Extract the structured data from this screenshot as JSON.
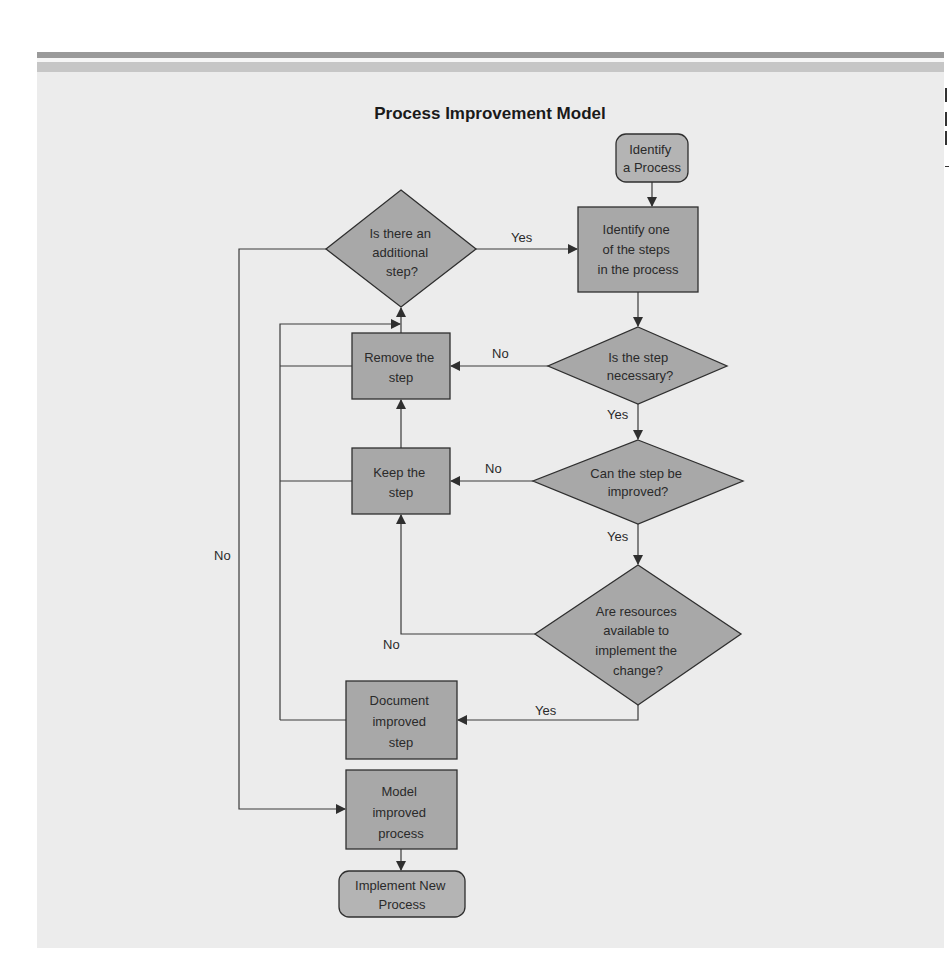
{
  "diagram": {
    "title": "Process Improvement Model",
    "nodes": {
      "start": {
        "lines": [
          "Identify",
          "a Process"
        ],
        "shape": "terminal"
      },
      "identify_step": {
        "lines": [
          "Identify one",
          "of the steps",
          "in the process"
        ],
        "shape": "process"
      },
      "necessary": {
        "lines": [
          "Is the step",
          "necessary?"
        ],
        "shape": "decision"
      },
      "improvable": {
        "lines": [
          "Can the step be",
          "improved?"
        ],
        "shape": "decision"
      },
      "resources": {
        "lines": [
          "Are resources",
          "available to",
          "implement the",
          "change?"
        ],
        "shape": "decision"
      },
      "remove": {
        "lines": [
          "Remove the",
          "step"
        ],
        "shape": "process"
      },
      "keep": {
        "lines": [
          "Keep the",
          "step"
        ],
        "shape": "process"
      },
      "document": {
        "lines": [
          "Document",
          "improved",
          "step"
        ],
        "shape": "process"
      },
      "additional": {
        "lines": [
          "Is there an",
          "additional",
          "step?"
        ],
        "shape": "decision"
      },
      "model": {
        "lines": [
          "Model",
          "improved",
          "process"
        ],
        "shape": "process"
      },
      "end": {
        "lines": [
          "Implement New",
          "Process"
        ],
        "shape": "terminal"
      }
    },
    "edges": [
      {
        "from": "start",
        "to": "identify_step",
        "label": ""
      },
      {
        "from": "identify_step",
        "to": "necessary",
        "label": ""
      },
      {
        "from": "necessary",
        "to": "improvable",
        "label": "Yes"
      },
      {
        "from": "necessary",
        "to": "remove",
        "label": "No"
      },
      {
        "from": "improvable",
        "to": "resources",
        "label": "Yes"
      },
      {
        "from": "improvable",
        "to": "keep",
        "label": "No"
      },
      {
        "from": "resources",
        "to": "document",
        "label": "Yes"
      },
      {
        "from": "resources",
        "to": "keep",
        "label": "No"
      },
      {
        "from": "keep",
        "to": "remove",
        "label": ""
      },
      {
        "from": "remove",
        "to": "additional",
        "label": ""
      },
      {
        "from": "document",
        "to": "additional",
        "label": ""
      },
      {
        "from": "additional",
        "to": "identify_step",
        "label": "Yes"
      },
      {
        "from": "additional",
        "to": "model",
        "label": "No"
      },
      {
        "from": "model",
        "to": "end",
        "label": ""
      }
    ],
    "labels": {
      "yes": "Yes",
      "no": "No"
    },
    "colors": {
      "panel_bg": "#ececec",
      "shape_fill": "#a8a8a8",
      "terminal_fill": "#b4b4b4",
      "stroke": "#2f2f2f",
      "header_bar_dark": "#9a9a9a",
      "header_bar_light": "#c6c6c6"
    }
  }
}
